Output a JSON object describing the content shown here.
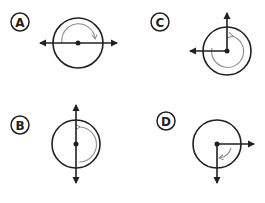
{
  "colors": {
    "ink": "#231f20",
    "arc": "#8c8c8c",
    "background": "#ffffff"
  },
  "options": [
    {
      "label": "A",
      "label_pos": [
        20,
        22
      ],
      "center": [
        78,
        43
      ],
      "radius": 25,
      "rays": [
        "left",
        "right"
      ],
      "rotation_arrow": {
        "direction": "clockwise",
        "degrees": 180,
        "from": "left",
        "to": "right"
      }
    },
    {
      "label": "B",
      "label_pos": [
        20,
        125
      ],
      "center": [
        76,
        144
      ],
      "radius": 24,
      "rays": [
        "up",
        "down"
      ],
      "rotation_arrow": {
        "direction": "clockwise",
        "degrees": 180,
        "from": "up",
        "to": "down"
      }
    },
    {
      "label": "C",
      "label_pos": [
        160,
        22
      ],
      "center": [
        227,
        51
      ],
      "radius": 24,
      "rays": [
        "up",
        "left"
      ],
      "rotation_arrow": {
        "direction": "clockwise",
        "degrees": 270,
        "from": "up",
        "to": "left"
      }
    },
    {
      "label": "D",
      "label_pos": [
        166,
        121
      ],
      "center": [
        217,
        144
      ],
      "radius": 24,
      "rays": [
        "right",
        "down"
      ],
      "rotation_arrow": {
        "direction": "clockwise",
        "degrees": 90,
        "from": "right",
        "to": "down"
      }
    }
  ]
}
